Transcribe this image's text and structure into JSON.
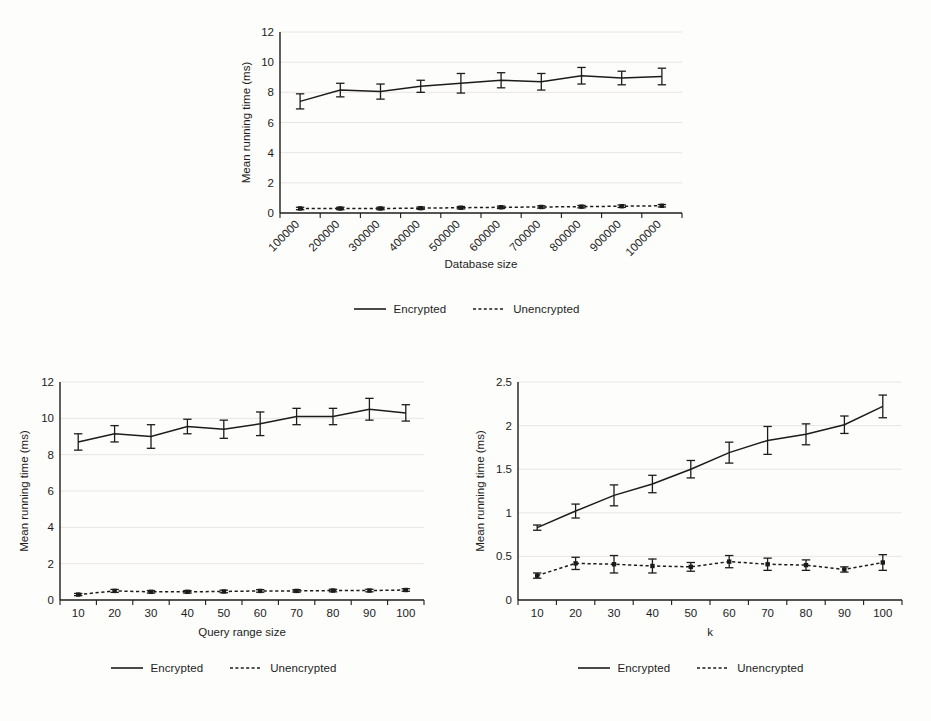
{
  "figure": {
    "background_color": "#fdfdfb",
    "ink_color": "#1c1c1c"
  },
  "legend": {
    "encrypted_label": "Encrypted",
    "unencrypted_label": "Unencrypted"
  },
  "chart_data": [
    {
      "id": "database-size",
      "type": "line",
      "title": "",
      "xlabel": "Database size",
      "ylabel": "Mean running time (ms)",
      "categories": [
        "100000",
        "200000",
        "300000",
        "400000",
        "500000",
        "600000",
        "700000",
        "800000",
        "900000",
        "1000000"
      ],
      "ylim": [
        0,
        12
      ],
      "yticks": [
        "0",
        "2",
        "4",
        "6",
        "8",
        "10",
        "12"
      ],
      "grid": true,
      "legend_position": "below",
      "series": [
        {
          "name": "Encrypted",
          "style": "solid",
          "values": [
            7.4,
            8.15,
            8.05,
            8.4,
            8.6,
            8.8,
            8.7,
            9.1,
            8.95,
            9.05
          ],
          "errors": [
            0.5,
            0.45,
            0.5,
            0.4,
            0.65,
            0.5,
            0.55,
            0.55,
            0.45,
            0.55
          ]
        },
        {
          "name": "Unencrypted",
          "style": "dotted",
          "values": [
            0.3,
            0.3,
            0.3,
            0.32,
            0.35,
            0.38,
            0.4,
            0.42,
            0.45,
            0.48
          ],
          "errors": [
            0.08,
            0.08,
            0.08,
            0.08,
            0.08,
            0.08,
            0.08,
            0.08,
            0.08,
            0.08
          ]
        }
      ]
    },
    {
      "id": "query-range-size",
      "type": "line",
      "title": "",
      "xlabel": "Query range size",
      "ylabel": "Mean running time (ms)",
      "categories": [
        "10",
        "20",
        "30",
        "40",
        "50",
        "60",
        "70",
        "80",
        "90",
        "100"
      ],
      "ylim": [
        0,
        12
      ],
      "yticks": [
        "0",
        "2",
        "4",
        "6",
        "8",
        "10",
        "12"
      ],
      "grid": true,
      "legend_position": "below",
      "series": [
        {
          "name": "Encrypted",
          "style": "solid",
          "values": [
            8.7,
            9.15,
            9.0,
            9.55,
            9.4,
            9.7,
            10.1,
            10.1,
            10.5,
            10.3
          ],
          "errors": [
            0.45,
            0.45,
            0.65,
            0.4,
            0.5,
            0.65,
            0.45,
            0.45,
            0.6,
            0.45
          ]
        },
        {
          "name": "Unencrypted",
          "style": "dotted",
          "values": [
            0.3,
            0.5,
            0.45,
            0.45,
            0.47,
            0.5,
            0.5,
            0.52,
            0.52,
            0.55
          ],
          "errors": [
            0.06,
            0.08,
            0.07,
            0.07,
            0.07,
            0.07,
            0.07,
            0.07,
            0.07,
            0.07
          ]
        }
      ]
    },
    {
      "id": "k",
      "type": "line",
      "title": "",
      "xlabel": "k",
      "ylabel": "Mean running time (ms)",
      "categories": [
        "10",
        "20",
        "30",
        "40",
        "50",
        "60",
        "70",
        "80",
        "90",
        "100"
      ],
      "ylim": [
        0,
        2.5
      ],
      "yticks": [
        "0",
        "0.5",
        "1",
        "1.5",
        "2",
        "2.5"
      ],
      "grid": true,
      "legend_position": "below",
      "series": [
        {
          "name": "Encrypted",
          "style": "solid",
          "values": [
            0.83,
            1.02,
            1.2,
            1.33,
            1.5,
            1.69,
            1.83,
            1.9,
            2.01,
            2.22
          ],
          "errors": [
            0.03,
            0.08,
            0.12,
            0.1,
            0.1,
            0.12,
            0.16,
            0.12,
            0.1,
            0.13
          ]
        },
        {
          "name": "Unencrypted",
          "style": "dotted",
          "values": [
            0.28,
            0.42,
            0.41,
            0.39,
            0.38,
            0.44,
            0.41,
            0.4,
            0.35,
            0.43
          ],
          "errors": [
            0.03,
            0.07,
            0.1,
            0.08,
            0.05,
            0.07,
            0.07,
            0.06,
            0.03,
            0.09
          ]
        }
      ]
    }
  ]
}
